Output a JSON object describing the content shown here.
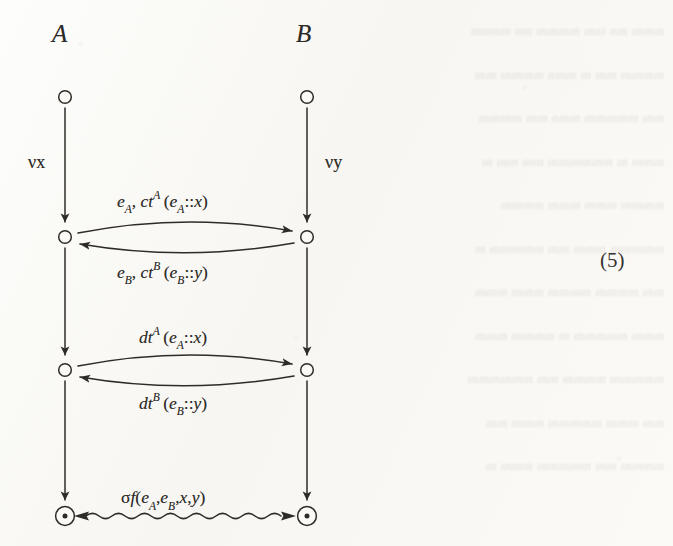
{
  "figure": {
    "caption_number": "(5)",
    "columns": [
      {
        "id": "A",
        "label": "A",
        "restriction": "νx"
      },
      {
        "id": "B",
        "label": "B",
        "restriction": "νy"
      }
    ],
    "lifeline_labels": {
      "left_restriction": "νx",
      "right_restriction": "νy"
    },
    "nodes": [
      {
        "name": "A-start",
        "column": "A",
        "shape": "open-circle",
        "x": 65,
        "y": 97
      },
      {
        "name": "B-start",
        "column": "B",
        "shape": "open-circle",
        "x": 307,
        "y": 97
      },
      {
        "name": "A-commit",
        "column": "A",
        "shape": "open-circle",
        "x": 65,
        "y": 237
      },
      {
        "name": "B-commit",
        "column": "B",
        "shape": "open-circle",
        "x": 307,
        "y": 237
      },
      {
        "name": "A-decommit",
        "column": "A",
        "shape": "open-circle",
        "x": 65,
        "y": 370
      },
      {
        "name": "B-decommit",
        "column": "B",
        "shape": "open-circle",
        "x": 307,
        "y": 370
      },
      {
        "name": "A-end",
        "column": "A",
        "shape": "circled-dot",
        "x": 65,
        "y": 516
      },
      {
        "name": "B-end",
        "column": "B",
        "shape": "circled-dot",
        "x": 307,
        "y": 516
      }
    ],
    "exchanges": [
      {
        "name": "commit-exchange",
        "direction": "A-to-B",
        "style": "curved-arrow",
        "label_parts": {
          "head": "e",
          "head_sub": "A",
          "fn": "ct",
          "fn_sup": "A",
          "arg": "(e",
          "arg_sub": "A",
          "tail": "::x)"
        },
        "label_text": "e_A, ct^A(e_A::x)"
      },
      {
        "name": "commit-ack-exchange",
        "direction": "B-to-A",
        "style": "curved-arrow",
        "label_parts": {
          "head": "e",
          "head_sub": "B",
          "fn": "ct",
          "fn_sup": "B",
          "arg": "(e",
          "arg_sub": "B",
          "tail": "::y)"
        },
        "label_text": "e_B, ct^B(e_B::y)"
      },
      {
        "name": "decommit-exchange",
        "direction": "A-to-B",
        "style": "curved-arrow",
        "label_parts": {
          "fn": "dt",
          "fn_sup": "A",
          "arg": "(e",
          "arg_sub": "A",
          "tail": "::x)"
        },
        "label_text": "dt^A(e_A::x)"
      },
      {
        "name": "decommit-ack-exchange",
        "direction": "B-to-A",
        "style": "curved-arrow",
        "label_parts": {
          "fn": "dt",
          "fn_sup": "B",
          "arg": "(e",
          "arg_sub": "B",
          "tail": "::y)"
        },
        "label_text": "dt^B(e_B::y)"
      },
      {
        "name": "output-agreement",
        "direction": "bidirectional",
        "style": "wavy-double-arrow",
        "label_parts": {
          "sigma": "σ",
          "fn": "f",
          "arg": "(e",
          "sub1": "A",
          "mid": ",e",
          "sub2": "B",
          "tail": ",x,y)"
        },
        "label_text": "σf(e_A,e_B,x,y)"
      }
    ],
    "colors": {
      "ink": "#2e2c29",
      "paper": "#fbfaf7",
      "ghost": "rgba(92,88,80,0.155)"
    }
  },
  "background_text": {
    "note": "illegible bleed-through from reverse page",
    "lines": [
      "mmm mn inm mmmm mn mnmm",
      "mmmm mm m mmn mmmm mm",
      "mm mmmmm mmn mm mmmm",
      "mmm m mmmmmm mm mm m",
      "mmmm mmm mmm mmmm",
      "mmmmm mmm mm mmmmm m",
      "mm mmmm mmmm mmm mmm",
      "mmm mmmmm m mmmm mmm",
      "mmmmm mmmm mm mmmmmm",
      "mm mmm mmmmm mmm mm",
      "mmmm mm mmmmm mmm m",
      "mmmmm mmmm mmm mmmmm",
      "mmm mmmm mmm mmm mmmm",
      "mmmmmm mm mmm mmmmm",
      "mm mmmm mmmmm mm mmm"
    ]
  }
}
